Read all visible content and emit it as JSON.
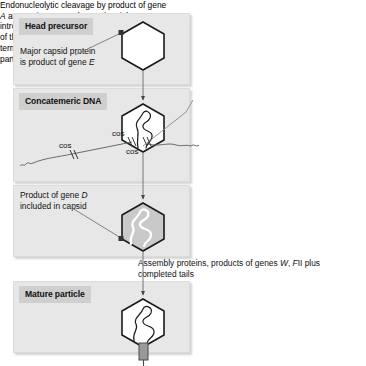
{
  "figure": {
    "type": "flow-diagram"
  },
  "panels": [
    {
      "id": "head-precursor",
      "header": "Head precursor",
      "header_style": "gray-chip",
      "caption_line1": "Major capsid protein",
      "caption_line2_pre": "is product of gene ",
      "caption_line2_italic": "E",
      "capsid": {
        "shape": "hexagon",
        "fill": "white",
        "contains_dna": false,
        "has_tail": false
      }
    },
    {
      "id": "concatemeric-dna",
      "header": "Concatemeric DNA",
      "header_style": "gray-chip",
      "capsid": {
        "shape": "hexagon",
        "fill": "white",
        "contains_dna": true,
        "has_tail": false
      },
      "cos_labels": [
        "cos",
        "cos",
        "cos"
      ]
    },
    {
      "id": "product-gene-d",
      "header": "",
      "header_style": "plain-text",
      "caption_line1_pre": "Product of gene ",
      "caption_line1_italic": "D",
      "caption_line2": "included in capsid",
      "capsid": {
        "shape": "hexagon",
        "fill": "gray",
        "contains_dna": true,
        "has_tail": false
      }
    },
    {
      "id": "mature-particle",
      "header": "Mature particle",
      "header_style": "gray-chip",
      "capsid": {
        "shape": "hexagon",
        "fill": "white",
        "contains_dna": true,
        "has_tail": true
      }
    }
  ],
  "annotations": {
    "endonucleolytic": {
      "seg1": "Endonucleolytic cleavage by product of gene ",
      "ital1": "A",
      "seg2": " at cos sites. At each cos site nicks are introduced 12 bp apart on opposite strands of the DNA, hence generating the cohesive termini of λDNA as it is found in the phage particle. ATP is required for this process"
    },
    "assembly": {
      "seg1": "Assembly proteins, products of genes ",
      "ital1": "W",
      "seg2": ", ",
      "ital2": "F",
      "seg3": "II plus completed tails"
    }
  },
  "colors": {
    "panel_bg": "#e7e7e7",
    "chip_bg": "#cfcfcf",
    "capsid_gray": "#c9c9c9",
    "line": "#595959",
    "text": "#111111",
    "page_bg": "#ffffff"
  }
}
